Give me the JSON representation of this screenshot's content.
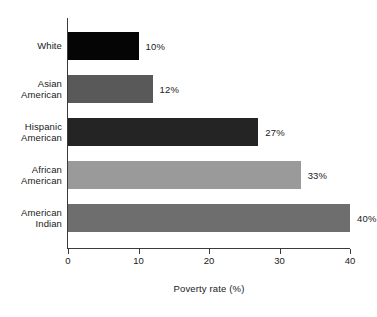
{
  "chart_data": {
    "type": "bar",
    "orientation": "horizontal",
    "title": "",
    "xlabel": "Poverty rate (%)",
    "ylabel": "",
    "xlim": [
      0,
      40
    ],
    "xticks": [
      0,
      10,
      20,
      30,
      40
    ],
    "xtick_labels": [
      "0",
      "10",
      "20",
      "30",
      "40"
    ],
    "grid": false,
    "legend": false,
    "categories": [
      "White",
      "Asian American",
      "Hispanic American",
      "African American",
      "American Indian"
    ],
    "values": [
      10,
      12,
      27,
      33,
      40
    ],
    "value_labels": [
      "10%",
      "12%",
      "27%",
      "33%",
      "40%"
    ],
    "bar_colors": [
      "#050505",
      "#595959",
      "#242424",
      "#9a9a9a",
      "#6e6e6e"
    ],
    "bars": [
      {
        "category_lines": [
          "White"
        ],
        "value": 10,
        "label": "10%",
        "color": "#050505"
      },
      {
        "category_lines": [
          "Asian",
          "American"
        ],
        "value": 12,
        "label": "12%",
        "color": "#595959"
      },
      {
        "category_lines": [
          "Hispanic",
          "American"
        ],
        "value": 27,
        "label": "27%",
        "color": "#242424"
      },
      {
        "category_lines": [
          "African",
          "American"
        ],
        "value": 33,
        "label": "33%",
        "color": "#9a9a9a"
      },
      {
        "category_lines": [
          "American",
          "Indian"
        ],
        "value": 40,
        "label": "40%",
        "color": "#6e6e6e"
      }
    ]
  },
  "axis": {
    "line_color": "#3a3a3a"
  }
}
